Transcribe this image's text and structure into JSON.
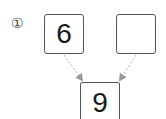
{
  "problem": {
    "marker": "①",
    "number_bond": {
      "part_left": "6",
      "part_right": "",
      "whole": "9"
    }
  },
  "colors": {
    "box_border": "#555555",
    "arrow": "#aaaaaa",
    "text": "#1a1a1a"
  }
}
